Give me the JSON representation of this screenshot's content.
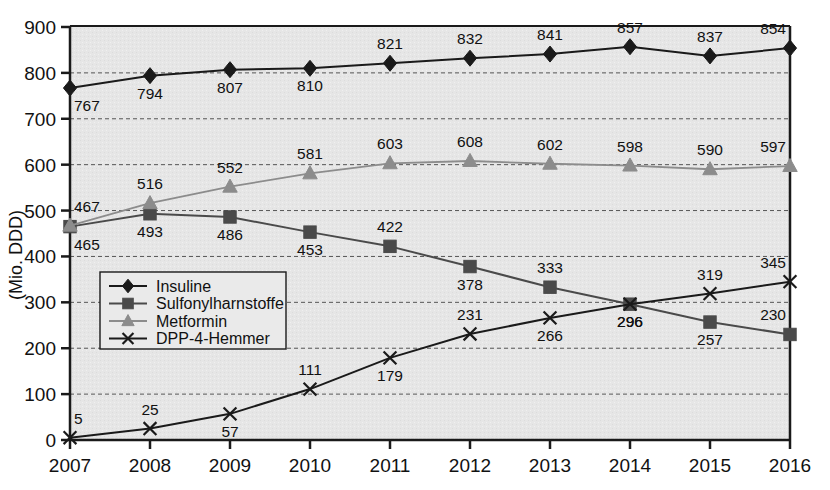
{
  "chart_data": {
    "type": "line",
    "title": "",
    "xlabel": "",
    "ylabel": "(Mio. DDD)",
    "x": [
      "2007",
      "2008",
      "2009",
      "2010",
      "2011",
      "2012",
      "2013",
      "2014",
      "2015",
      "2016"
    ],
    "categories": [
      "2007",
      "2008",
      "2009",
      "2010",
      "2011",
      "2012",
      "2013",
      "2014",
      "2015",
      "2016"
    ],
    "ylim": [
      0,
      900
    ],
    "yticks": [
      "0",
      "100",
      "200",
      "300",
      "400",
      "500",
      "600",
      "700",
      "800",
      "900"
    ],
    "grid": "horizontal-dashed",
    "legend_position": "inside-left-lower",
    "series": [
      {
        "name": "Insuline",
        "marker": "diamond",
        "color": "#1a1a1a",
        "values": [
          767,
          794,
          807,
          810,
          821,
          832,
          841,
          857,
          837,
          854
        ],
        "label_side": [
          "below",
          "below",
          "below",
          "below",
          "above",
          "above",
          "above",
          "above",
          "above",
          "above"
        ]
      },
      {
        "name": "Sulfonylharnstoffe",
        "marker": "square",
        "color": "#4a4a4a",
        "values": [
          465,
          493,
          486,
          453,
          422,
          378,
          333,
          296,
          257,
          230
        ],
        "label_side": [
          "below",
          "below",
          "below",
          "below",
          "above",
          "below",
          "above",
          "below",
          "below",
          "above"
        ]
      },
      {
        "name": "Metformin",
        "marker": "triangle",
        "color": "#8c8c8c",
        "values": [
          467,
          516,
          552,
          581,
          603,
          608,
          602,
          598,
          590,
          597
        ],
        "label_side": [
          "above",
          "above",
          "above",
          "above",
          "above",
          "above",
          "above",
          "above",
          "above",
          "above"
        ]
      },
      {
        "name": "DPP-4-Hemmer",
        "marker": "cross",
        "color": "#1a1a1a",
        "values": [
          5,
          25,
          57,
          111,
          179,
          231,
          266,
          296,
          319,
          345
        ],
        "label_side": [
          "above",
          "above",
          "below",
          "above",
          "below",
          "above",
          "below",
          "below",
          "above",
          "above"
        ]
      }
    ]
  },
  "style": {
    "plot_background": "#e6e6e6",
    "axis_color": "#1a1a1a",
    "grid_color": "#555555",
    "legend_background": "#eaeaea",
    "legend_border": "#1a1a1a"
  }
}
